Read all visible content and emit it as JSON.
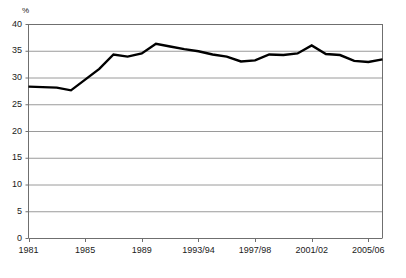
{
  "chart_data": {
    "type": "line",
    "title": "",
    "xlabel": "",
    "ylabel": "%",
    "ylim": [
      0,
      40
    ],
    "yticks": [
      0,
      5,
      10,
      15,
      20,
      25,
      30,
      35,
      40
    ],
    "ytick_labels": [
      "0",
      "5",
      "10",
      "15",
      "20",
      "25",
      "30",
      "35",
      "40"
    ],
    "xtick_labels": [
      "1981",
      "1985",
      "1989",
      "1993/94",
      "1997/98",
      "2001/02",
      "2005/06"
    ],
    "xtick_values": [
      1981,
      1985,
      1989,
      1993,
      1997,
      2001,
      2005
    ],
    "xlim": [
      1981,
      2006
    ],
    "grid": "horizontal",
    "legend": "none",
    "line_color": "#000000",
    "grid_color": "#9a9a9a",
    "axis_color": "#6f6f6f",
    "x": [
      1981,
      1982,
      1983,
      1984,
      1985,
      1986,
      1987,
      1988,
      1989,
      1990,
      1991,
      1992,
      1993,
      1994,
      1995,
      1996,
      1997,
      1998,
      1999,
      2000,
      2001,
      2002,
      2003,
      2004,
      2005,
      2006
    ],
    "series": [
      {
        "name": "value",
        "values": [
          28.3,
          28.2,
          28.1,
          27.6,
          29.6,
          31.6,
          34.3,
          33.9,
          34.5,
          36.3,
          35.8,
          35.3,
          34.9,
          34.3,
          33.9,
          33.0,
          33.2,
          34.3,
          34.2,
          34.5,
          36.0,
          34.4,
          34.2,
          33.1,
          32.9,
          33.4
        ]
      }
    ]
  }
}
